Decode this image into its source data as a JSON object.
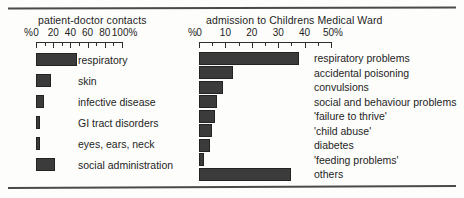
{
  "figure": {
    "background_color": "#fdfdfc",
    "bar_color": "#3b3b3b",
    "bar_outline_color": "#232323",
    "rule_color": "#4a4a4a",
    "text_color": "#1d1d1d"
  },
  "chart_data": [
    {
      "type": "bar",
      "orientation": "horizontal",
      "id": "patient-doctor-contacts",
      "title": "patient-doctor contacts",
      "xlabel": "",
      "ylabel": "",
      "unit_prefix": "%",
      "unit_suffix": "%",
      "xlim": [
        0,
        100
      ],
      "grid": false,
      "legend": "none",
      "tick_interval": 10,
      "label_interval": 20,
      "tick_labels": [
        "0",
        "20",
        "40",
        "60",
        "80",
        "100"
      ],
      "tick_values": [
        0,
        20,
        40,
        60,
        80,
        100
      ],
      "axis_start_label": "%",
      "axis_end_label": "%",
      "categories": [
        "respiratory",
        "skin",
        "infective disease",
        "GI tract disorders",
        "eyes, ears, neck",
        "social administration"
      ],
      "values": [
        48,
        17,
        9,
        5,
        5,
        22
      ]
    },
    {
      "type": "bar",
      "orientation": "horizontal",
      "id": "childrens-medical-ward-admissions",
      "title": "admission to Childrens Medical Ward",
      "xlabel": "",
      "ylabel": "",
      "unit_prefix": "%",
      "unit_suffix": "%",
      "xlim": [
        0,
        50
      ],
      "grid": false,
      "legend": "none",
      "tick_interval": 5,
      "label_interval": 10,
      "tick_labels": [
        "0",
        "10",
        "20",
        "30",
        "40",
        "50"
      ],
      "tick_values": [
        0,
        10,
        20,
        30,
        40,
        50
      ],
      "axis_start_label": "%",
      "axis_end_label": "%",
      "categories": [
        "respiratory problems",
        "accidental poisoning",
        "convulsions",
        "social and behaviour problems",
        "'failure to thrive'",
        "'child abuse'",
        "diabetes",
        "'feeding problems'",
        "others"
      ],
      "values": [
        38,
        13,
        9,
        7,
        6,
        5,
        4,
        2,
        35
      ]
    }
  ]
}
